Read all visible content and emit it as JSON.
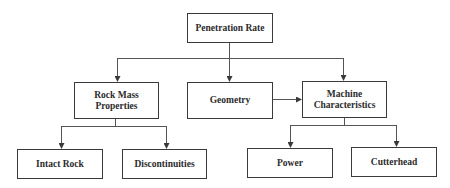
{
  "diagram": {
    "type": "hierarchy-flowchart",
    "nodes": [
      {
        "id": "root",
        "label": "Penetration Rate",
        "level": 0
      },
      {
        "id": "rock_mass",
        "label": "Rock Mass Properties",
        "line1": "Rock Mass",
        "line2": "Properties",
        "level": 1
      },
      {
        "id": "geometry",
        "label": "Geometry",
        "level": 1
      },
      {
        "id": "machine",
        "label": "Machine Characteristics",
        "line1": "Machine",
        "line2": "Characteristics",
        "level": 1
      },
      {
        "id": "intact_rock",
        "label": "Intact Rock",
        "level": 2
      },
      {
        "id": "discontinuities",
        "label": "Discontinuities",
        "level": 2
      },
      {
        "id": "power",
        "label": "Power",
        "level": 2
      },
      {
        "id": "cutterhead",
        "label": "Cutterhead",
        "level": 2
      }
    ],
    "edges": [
      {
        "from": "root",
        "to": "rock_mass"
      },
      {
        "from": "root",
        "to": "geometry"
      },
      {
        "from": "root",
        "to": "machine"
      },
      {
        "from": "geometry",
        "to": "machine"
      },
      {
        "from": "rock_mass",
        "to": "intact_rock"
      },
      {
        "from": "rock_mass",
        "to": "discontinuities"
      },
      {
        "from": "machine",
        "to": "power"
      },
      {
        "from": "machine",
        "to": "cutterhead"
      }
    ],
    "colors": {
      "line": "#3a3a3a",
      "text": "#2b2b2b",
      "background": "#ffffff"
    }
  }
}
